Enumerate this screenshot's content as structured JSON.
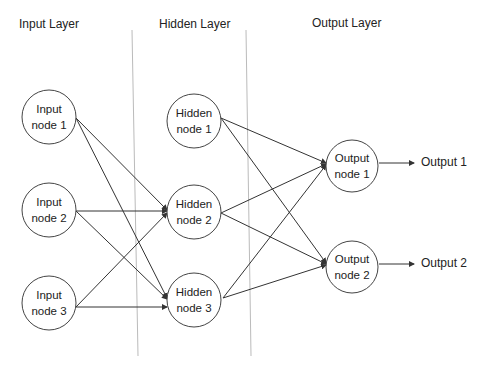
{
  "layers": {
    "input": {
      "title": "Input Layer"
    },
    "hidden": {
      "title": "Hidden Layer"
    },
    "output": {
      "title": "Output Layer"
    }
  },
  "nodes": {
    "input": [
      {
        "line1": "Input",
        "line2": "node 1"
      },
      {
        "line1": "Input",
        "line2": "node 2"
      },
      {
        "line1": "Input",
        "line2": "node 3"
      }
    ],
    "hidden": [
      {
        "line1": "Hidden",
        "line2": "node 1"
      },
      {
        "line1": "Hidden",
        "line2": "node 2"
      },
      {
        "line1": "Hidden",
        "line2": "node 3"
      }
    ],
    "output": [
      {
        "line1": "Output",
        "line2": "node 1"
      },
      {
        "line1": "Output",
        "line2": "node 2"
      }
    ]
  },
  "outputs": [
    "Output 1",
    "Output 2"
  ],
  "colors": {
    "stroke": "#333333",
    "divider": "#bbbbbb"
  }
}
